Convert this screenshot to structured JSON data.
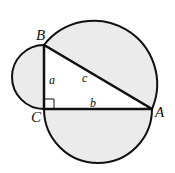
{
  "diagram": {
    "type": "geometry",
    "vertices": {
      "A": {
        "label": "A"
      },
      "B": {
        "label": "B"
      },
      "C": {
        "label": "C"
      }
    },
    "sides": {
      "a": {
        "label": "a",
        "between": "B-C"
      },
      "b": {
        "label": "b",
        "between": "C-A"
      },
      "c": {
        "label": "c",
        "between": "A-B"
      }
    },
    "right_angle_at": "C",
    "colors": {
      "fill": "#ebebeb",
      "stroke": "#111111",
      "triangle_fill": "#ffffff"
    }
  }
}
